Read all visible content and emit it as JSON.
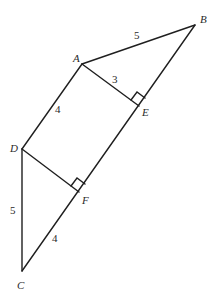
{
  "diagram": {
    "points": {
      "A": {
        "label": "A",
        "x": 82,
        "y": 64
      },
      "B": {
        "label": "B",
        "x": 195,
        "y": 25
      },
      "C": {
        "label": "C",
        "x": 22,
        "y": 271
      },
      "D": {
        "label": "D",
        "x": 22,
        "y": 149
      },
      "E": {
        "label": "E",
        "x": 139,
        "y": 106
      },
      "F": {
        "label": "F",
        "x": 79,
        "y": 192
      }
    },
    "segments": [
      {
        "from": "A",
        "to": "B",
        "length_label": "5"
      },
      {
        "from": "A",
        "to": "E",
        "length_label": "3"
      },
      {
        "from": "A",
        "to": "D",
        "length_label": "4"
      },
      {
        "from": "D",
        "to": "C",
        "length_label": "5"
      },
      {
        "from": "F",
        "to": "C",
        "length_label": "4"
      },
      {
        "from": "D",
        "to": "F",
        "length_label": ""
      },
      {
        "from": "B",
        "to": "C",
        "length_label": ""
      }
    ],
    "right_angles": [
      "E",
      "F"
    ],
    "labels": {
      "A": "A",
      "B": "B",
      "C": "C",
      "D": "D",
      "E": "E",
      "F": "F",
      "AB": "5",
      "AE": "3",
      "AD": "4",
      "DC": "5",
      "FC": "4"
    },
    "colors": {
      "stroke": "#1f1f1f",
      "text": "#2a2a2a",
      "background": "#ffffff"
    }
  }
}
